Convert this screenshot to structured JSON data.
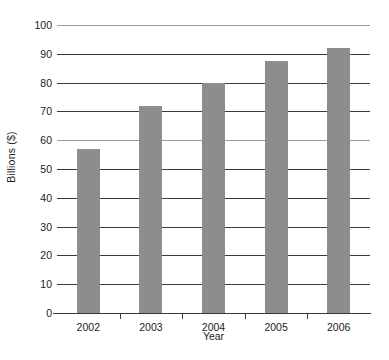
{
  "chart_data": {
    "type": "bar",
    "title": "",
    "categories": [
      "2002",
      "2003",
      "2004",
      "2005",
      "2006"
    ],
    "values": [
      57,
      72,
      80,
      87.5,
      92
    ],
    "series": [
      {
        "name": "Billions ($)",
        "values": [
          57,
          72,
          80,
          87.5,
          92
        ]
      }
    ],
    "xlabel": "Year",
    "ylabel": "Billions ($)",
    "ylim": [
      0,
      100
    ],
    "yticks": [
      0,
      10,
      20,
      30,
      40,
      50,
      60,
      70,
      80,
      90,
      100
    ],
    "ytick_labels": [
      "0",
      "10",
      "20",
      "30",
      "40",
      "50",
      "60",
      "70",
      "80",
      "90",
      "100"
    ],
    "grid": true,
    "grid_axis": "y",
    "legend": false,
    "legend_position": "none",
    "bar_color": "#8d8d8d",
    "axis_color": "#3a3a3a",
    "text_color": "#1c1c1c",
    "background_color": "#ffffff"
  }
}
